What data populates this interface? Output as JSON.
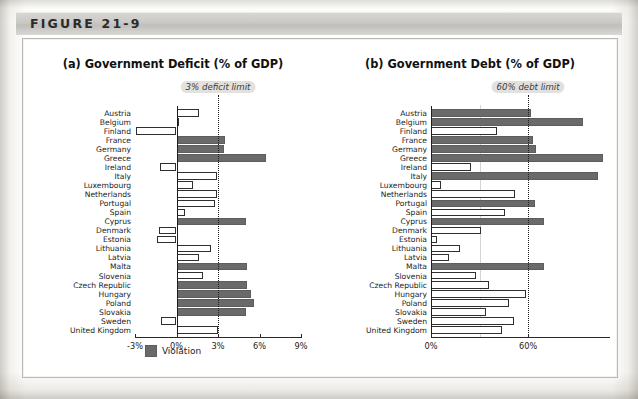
{
  "figure": {
    "header_label": "FIGURE 21-9"
  },
  "legend": {
    "violation_label": "Violation",
    "violation_color": "#6a6a6a",
    "ok_color": "#ffffff"
  },
  "panels": {
    "a": {
      "title": "(a) Government Deficit (% of GDP)",
      "limit_label": "3% deficit limit",
      "limit_value": 3,
      "tick_labels": [
        "-3%",
        "0%",
        "3%",
        "6%",
        "9%"
      ],
      "tick_values": [
        -3,
        0,
        3,
        6,
        9
      ]
    },
    "b": {
      "title": "(b) Government Debt (% of GDP)",
      "limit_label": "60% debt limit",
      "limit_value": 60,
      "tick_labels": [
        "0%",
        "60%"
      ],
      "tick_values": [
        0,
        60
      ]
    }
  },
  "countries": [
    "Austria",
    "Belgium",
    "Finland",
    "France",
    "Germany",
    "Greece",
    "Ireland",
    "Italy",
    "Luxembourg",
    "Netherlands",
    "Portugal",
    "Spain",
    "Cyprus",
    "Denmark",
    "Estonia",
    "Lithuania",
    "Latvia",
    "Malta",
    "Slovenia",
    "Czech Republic",
    "Hungary",
    "Poland",
    "Slovakia",
    "Sweden",
    "United Kingdom"
  ],
  "chart_data": [
    {
      "type": "bar",
      "orientation": "horizontal",
      "title": "(a) Government Deficit (% of GDP)",
      "xlabel": "",
      "ylabel": "",
      "xlim": [
        -3,
        9
      ],
      "grid": false,
      "legend_position": "bottom-center",
      "annotations": [
        "3% deficit limit"
      ],
      "threshold": 3,
      "categories": [
        "Austria",
        "Belgium",
        "Finland",
        "France",
        "Germany",
        "Greece",
        "Ireland",
        "Italy",
        "Luxembourg",
        "Netherlands",
        "Portugal",
        "Spain",
        "Cyprus",
        "Denmark",
        "Estonia",
        "Lithuania",
        "Latvia",
        "Malta",
        "Slovenia",
        "Czech Republic",
        "Hungary",
        "Poland",
        "Slovakia",
        "Sweden",
        "United Kingdom"
      ],
      "values": [
        1.6,
        0.0,
        -2.9,
        3.5,
        3.4,
        6.5,
        -1.2,
        2.9,
        1.2,
        2.9,
        2.8,
        0.6,
        5.0,
        -1.3,
        -1.4,
        2.5,
        1.6,
        5.1,
        1.9,
        5.1,
        5.4,
        5.6,
        5.0,
        -1.1,
        3.0
      ],
      "violations": [
        false,
        false,
        false,
        true,
        true,
        true,
        false,
        false,
        false,
        false,
        false,
        false,
        true,
        false,
        false,
        false,
        false,
        true,
        false,
        true,
        true,
        true,
        true,
        false,
        false
      ]
    },
    {
      "type": "bar",
      "orientation": "horizontal",
      "title": "(b) Government Debt (% of GDP)",
      "xlabel": "",
      "ylabel": "",
      "xlim": [
        0,
        110
      ],
      "grid": false,
      "legend_position": "none",
      "annotations": [
        "60% debt limit"
      ],
      "threshold": 60,
      "categories": [
        "Austria",
        "Belgium",
        "Finland",
        "France",
        "Germany",
        "Greece",
        "Ireland",
        "Italy",
        "Luxembourg",
        "Netherlands",
        "Portugal",
        "Spain",
        "Cyprus",
        "Denmark",
        "Estonia",
        "Lithuania",
        "Latvia",
        "Malta",
        "Slovenia",
        "Czech Republic",
        "Hungary",
        "Poland",
        "Slovakia",
        "Sweden",
        "United Kingdom"
      ],
      "values": [
        62.0,
        94.0,
        41.0,
        63.0,
        65.0,
        106.0,
        25.0,
        103.0,
        6.0,
        52.0,
        64.0,
        46.0,
        70.0,
        31.0,
        4.0,
        18.0,
        11.0,
        70.0,
        28.0,
        36.0,
        59.0,
        48.0,
        34.0,
        51.0,
        44.0
      ],
      "violations": [
        true,
        true,
        false,
        true,
        true,
        true,
        false,
        true,
        false,
        false,
        true,
        false,
        true,
        false,
        false,
        false,
        false,
        true,
        false,
        false,
        false,
        false,
        false,
        false,
        false
      ]
    }
  ]
}
